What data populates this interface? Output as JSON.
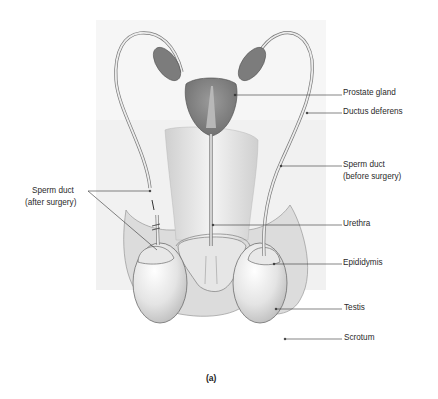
{
  "figure": {
    "caption": "(a)",
    "labels": {
      "prostate_gland": "Prostate gland",
      "ductus_deferens": "Ductus deferens",
      "sperm_duct_before_l1": "Sperm duct",
      "sperm_duct_before_l2": "(before surgery)",
      "sperm_duct_after_l1": "Sperm duct",
      "sperm_duct_after_l2": "(after surgery)",
      "urethra": "Urethra",
      "epididymis": "Epididymis",
      "testis": "Testis",
      "scrotum": "Scrotum"
    }
  }
}
